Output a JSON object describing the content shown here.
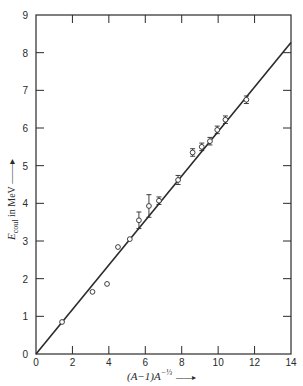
{
  "chart_data": {
    "type": "scatter",
    "title": "",
    "xlabel": "(A−1)A^(−1/3) →",
    "ylabel": "E_coul in MeV →",
    "xlim": [
      0,
      14
    ],
    "ylim": [
      0,
      9
    ],
    "xticks": [
      0,
      2,
      4,
      6,
      8,
      10,
      12,
      14
    ],
    "yticks": [
      0,
      1,
      2,
      3,
      4,
      5,
      6,
      7,
      8,
      9
    ],
    "grid": false,
    "legend": null,
    "series": [
      {
        "name": "measured",
        "marker": "open-circle",
        "points": [
          {
            "x": 1.43,
            "y": 0.85,
            "err": 0.0
          },
          {
            "x": 3.1,
            "y": 1.65,
            "err": 0.0
          },
          {
            "x": 3.9,
            "y": 1.86,
            "err": 0.0
          },
          {
            "x": 4.5,
            "y": 2.84,
            "err": 0.0
          },
          {
            "x": 5.15,
            "y": 3.05,
            "err": 0.0
          },
          {
            "x": 5.65,
            "y": 3.55,
            "err": 0.22
          },
          {
            "x": 6.2,
            "y": 3.93,
            "err": 0.3
          },
          {
            "x": 6.75,
            "y": 4.07,
            "err": 0.1
          },
          {
            "x": 7.8,
            "y": 4.62,
            "err": 0.12
          },
          {
            "x": 8.6,
            "y": 5.35,
            "err": 0.1
          },
          {
            "x": 9.1,
            "y": 5.5,
            "err": 0.1
          },
          {
            "x": 9.55,
            "y": 5.65,
            "err": 0.1
          },
          {
            "x": 9.95,
            "y": 5.95,
            "err": 0.1
          },
          {
            "x": 10.4,
            "y": 6.22,
            "err": 0.1
          },
          {
            "x": 11.55,
            "y": 6.75,
            "err": 0.1
          }
        ]
      },
      {
        "name": "fit",
        "type": "line",
        "points": [
          {
            "x": 0,
            "y": 0
          },
          {
            "x": 14,
            "y": 8.27
          }
        ]
      }
    ]
  },
  "axes": {
    "x_label_main": "(A−1)A",
    "x_label_sup": "−⅓",
    "x_label_arrow": "——▸",
    "y_label_main": "E",
    "y_label_sub": "coul",
    "y_label_rest": " in MeV ——▸"
  }
}
